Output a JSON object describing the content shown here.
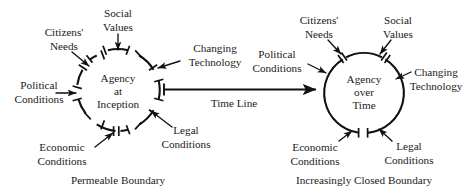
{
  "figure": {
    "left_panel": {
      "circle_label_lines": [
        "Agency",
        "at",
        "Inception"
      ],
      "caption": "Permeable Boundary",
      "influences": [
        {
          "name": "citizens-needs",
          "lines": [
            "Citizens'",
            "Needs"
          ]
        },
        {
          "name": "social-values",
          "lines": [
            "Social",
            "Values"
          ]
        },
        {
          "name": "changing-technology",
          "lines": [
            "Changing",
            "Technology"
          ]
        },
        {
          "name": "political-conditions",
          "lines": [
            "Political",
            "Conditions"
          ]
        },
        {
          "name": "economic-conditions",
          "lines": [
            "Economic",
            "Conditions"
          ]
        },
        {
          "name": "legal-conditions",
          "lines": [
            "Legal",
            "Conditions"
          ]
        }
      ]
    },
    "right_panel": {
      "circle_label_lines": [
        "Agency",
        "over",
        "Time"
      ],
      "caption": "Increasingly Closed Boundary",
      "influences": [
        {
          "name": "citizens-needs",
          "lines": [
            "Citizens'",
            "Needs"
          ]
        },
        {
          "name": "social-values",
          "lines": [
            "Social",
            "Values"
          ]
        },
        {
          "name": "changing-technology",
          "lines": [
            "Changing",
            "Technology"
          ]
        },
        {
          "name": "political-conditions",
          "lines": [
            "Political",
            "Conditions"
          ]
        },
        {
          "name": "economic-conditions",
          "lines": [
            "Economic",
            "Conditions"
          ]
        },
        {
          "name": "legal-conditions",
          "lines": [
            "Legal",
            "Conditions"
          ]
        }
      ]
    },
    "timeline": {
      "label": "Time Line"
    },
    "colors": {
      "ink": "#111111",
      "text": "#1a1a1a",
      "background": "#ffffff"
    }
  }
}
